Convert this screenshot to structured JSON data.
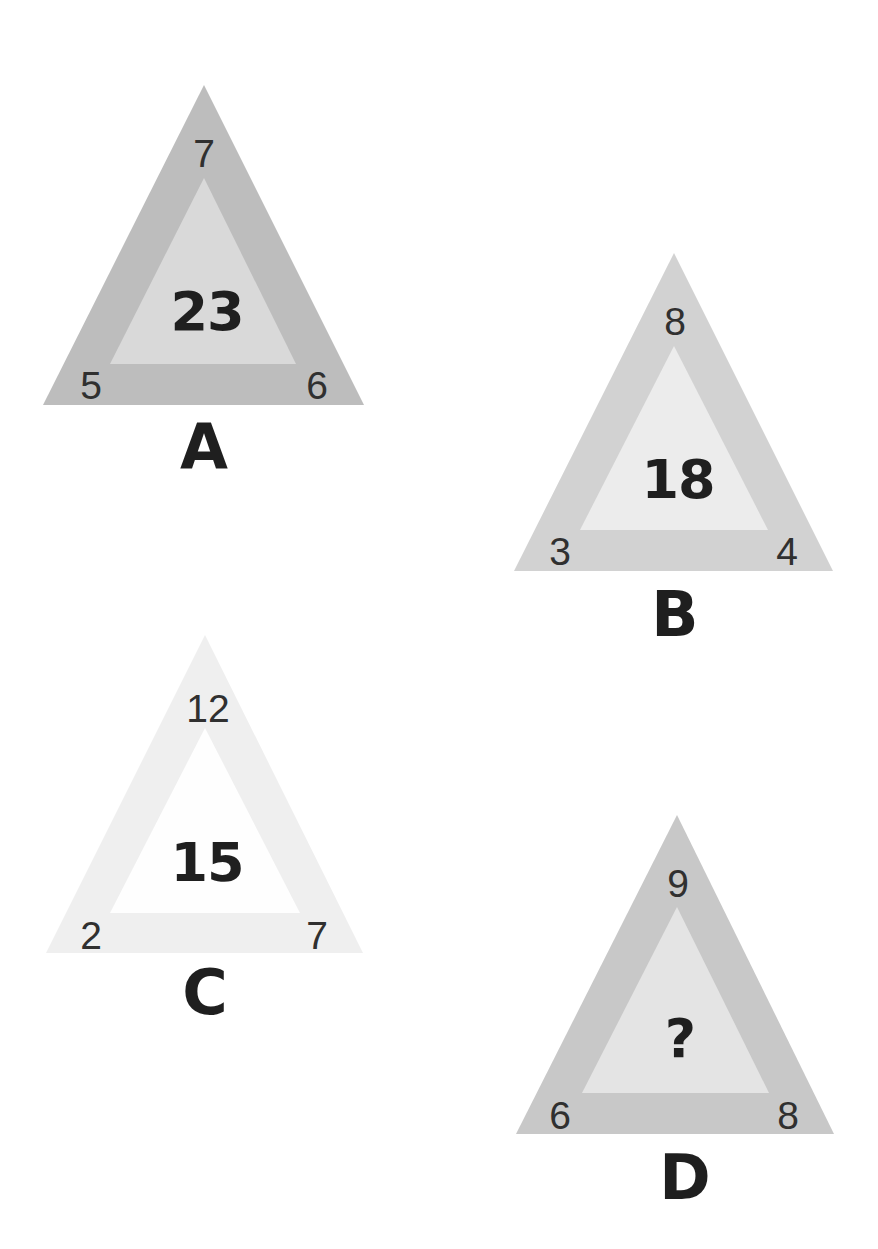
{
  "puzzle": {
    "type": "number-triangle-puzzle",
    "triangles": [
      {
        "id": "A",
        "label": "A",
        "top": "7",
        "bottom_left": "5",
        "bottom_right": "6",
        "center": "23",
        "outer_color": "#bdbdbd",
        "inner_color": "#d9d9d9"
      },
      {
        "id": "B",
        "label": "B",
        "top": "8",
        "bottom_left": "3",
        "bottom_right": "4",
        "center": "18",
        "outer_color": "#d2d2d2",
        "inner_color": "#ececec"
      },
      {
        "id": "C",
        "label": "C",
        "top": "12",
        "bottom_left": "2",
        "bottom_right": "7",
        "center": "15",
        "outer_color": "#efefef",
        "inner_color": "#fefefe"
      },
      {
        "id": "D",
        "label": "D",
        "top": "9",
        "bottom_left": "6",
        "bottom_right": "8",
        "center": "?",
        "outer_color": "#c8c8c8",
        "inner_color": "#e4e4e4"
      }
    ]
  }
}
